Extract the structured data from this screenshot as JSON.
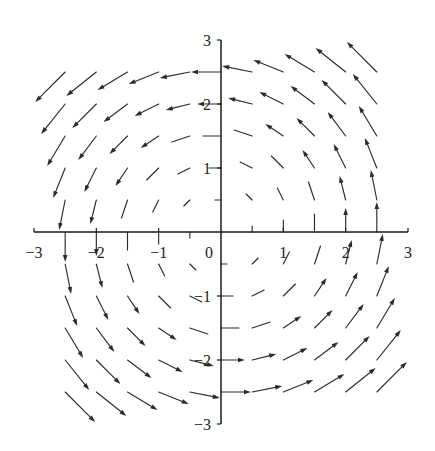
{
  "chart_data": {
    "type": "quiver",
    "title": "",
    "xlabel": "",
    "ylabel": "",
    "xlim": [
      -3,
      3
    ],
    "ylim": [
      -3,
      3
    ],
    "grid": false,
    "legend": null,
    "axes_through_origin": true,
    "arrow_grid_spacing": 0.5,
    "xticks": [
      -3,
      -2,
      -1,
      0,
      1,
      2,
      3
    ],
    "xtick_labels": [
      "−3",
      "−2",
      "−1",
      "0",
      "1",
      "2",
      "3"
    ],
    "yticks": [
      3,
      2,
      1,
      -1,
      -2,
      -3
    ],
    "ytick_labels": [
      "3",
      "2",
      "1",
      "−1",
      "−2",
      "−3"
    ],
    "colors": {
      "arrow": "#2b2b2b",
      "axis": "#1a1a1a",
      "background": "#ffffff"
    },
    "vectors_format": [
      "x",
      "y",
      "u",
      "v"
    ],
    "vectors": [
      [
        -2.5,
        2.5,
        -2.5,
        -2.5
      ],
      [
        -2,
        2.5,
        -2.5,
        -2
      ],
      [
        -1.5,
        2.5,
        -2.5,
        -1.5
      ],
      [
        -1,
        2.5,
        -2.5,
        -1
      ],
      [
        -0.5,
        2.5,
        -2.5,
        -0.5
      ],
      [
        0,
        2.5,
        -2.5,
        0
      ],
      [
        0.5,
        2.5,
        -2.5,
        0.5
      ],
      [
        1,
        2.5,
        -2.5,
        1
      ],
      [
        1.5,
        2.5,
        -2.5,
        1.5
      ],
      [
        2,
        2.5,
        -2.5,
        2
      ],
      [
        2.5,
        2.5,
        -2.5,
        2.5
      ],
      [
        -2.5,
        2,
        -2,
        -2.5
      ],
      [
        -2,
        2,
        -2,
        -2
      ],
      [
        -1.5,
        2,
        -2,
        -1.5
      ],
      [
        -1,
        2,
        -2,
        -1
      ],
      [
        -0.5,
        2,
        -2,
        -0.5
      ],
      [
        0,
        2,
        -2,
        0
      ],
      [
        0.5,
        2,
        -2,
        0.5
      ],
      [
        1,
        2,
        -2,
        1
      ],
      [
        1.5,
        2,
        -2,
        1.5
      ],
      [
        2,
        2,
        -2,
        2
      ],
      [
        2.5,
        2,
        -2,
        2.5
      ],
      [
        -2.5,
        1.5,
        -1.5,
        -2.5
      ],
      [
        -2,
        1.5,
        -1.5,
        -2
      ],
      [
        -1.5,
        1.5,
        -1.5,
        -1.5
      ],
      [
        -1,
        1.5,
        -1.5,
        -1
      ],
      [
        -0.5,
        1.5,
        -1.5,
        -0.5
      ],
      [
        0,
        1.5,
        -1.5,
        0
      ],
      [
        0.5,
        1.5,
        -1.5,
        0.5
      ],
      [
        1,
        1.5,
        -1.5,
        1
      ],
      [
        1.5,
        1.5,
        -1.5,
        1.5
      ],
      [
        2,
        1.5,
        -1.5,
        2
      ],
      [
        2.5,
        1.5,
        -1.5,
        2.5
      ],
      [
        -2.5,
        1,
        -1,
        -2.5
      ],
      [
        -2,
        1,
        -1,
        -2
      ],
      [
        -1.5,
        1,
        -1,
        -1.5
      ],
      [
        -1,
        1,
        -1,
        -1
      ],
      [
        -0.5,
        1,
        -1,
        -0.5
      ],
      [
        0,
        1,
        -1,
        0
      ],
      [
        0.5,
        1,
        -1,
        0.5
      ],
      [
        1,
        1,
        -1,
        1
      ],
      [
        1.5,
        1,
        -1,
        1.5
      ],
      [
        2,
        1,
        -1,
        2
      ],
      [
        2.5,
        1,
        -1,
        2.5
      ],
      [
        -2.5,
        0.5,
        -0.5,
        -2.5
      ],
      [
        -2,
        0.5,
        -0.5,
        -2
      ],
      [
        -1.5,
        0.5,
        -0.5,
        -1.5
      ],
      [
        -1,
        0.5,
        -0.5,
        -1
      ],
      [
        -0.5,
        0.5,
        -0.5,
        -0.5
      ],
      [
        0,
        0.5,
        -0.5,
        0
      ],
      [
        0.5,
        0.5,
        -0.5,
        0.5
      ],
      [
        1,
        0.5,
        -0.5,
        1
      ],
      [
        1.5,
        0.5,
        -0.5,
        1.5
      ],
      [
        2,
        0.5,
        -0.5,
        2
      ],
      [
        2.5,
        0.5,
        -0.5,
        2.5
      ],
      [
        -2.5,
        0,
        0,
        -2.5
      ],
      [
        -2,
        0,
        0,
        -2
      ],
      [
        -1.5,
        0,
        0,
        -1.5
      ],
      [
        -1,
        0,
        0,
        -1
      ],
      [
        -0.5,
        0,
        0,
        -0.5
      ],
      [
        0,
        0,
        0,
        0
      ],
      [
        0.5,
        0,
        0,
        0.5
      ],
      [
        1,
        0,
        0,
        1
      ],
      [
        1.5,
        0,
        0,
        1.5
      ],
      [
        2,
        0,
        0,
        2
      ],
      [
        2.5,
        0,
        0,
        2.5
      ],
      [
        -2.5,
        -0.5,
        0.5,
        -2.5
      ],
      [
        -2,
        -0.5,
        0.5,
        -2
      ],
      [
        -1.5,
        -0.5,
        0.5,
        -1.5
      ],
      [
        -1,
        -0.5,
        0.5,
        -1
      ],
      [
        -0.5,
        -0.5,
        0.5,
        -0.5
      ],
      [
        0,
        -0.5,
        0.5,
        0
      ],
      [
        0.5,
        -0.5,
        0.5,
        0.5
      ],
      [
        1,
        -0.5,
        0.5,
        1
      ],
      [
        1.5,
        -0.5,
        0.5,
        1.5
      ],
      [
        2,
        -0.5,
        0.5,
        2
      ],
      [
        2.5,
        -0.5,
        0.5,
        2.5
      ],
      [
        -2.5,
        -1,
        1,
        -2.5
      ],
      [
        -2,
        -1,
        1,
        -2
      ],
      [
        -1.5,
        -1,
        1,
        -1.5
      ],
      [
        -1,
        -1,
        1,
        -1
      ],
      [
        -0.5,
        -1,
        1,
        -0.5
      ],
      [
        0,
        -1,
        1,
        0
      ],
      [
        0.5,
        -1,
        1,
        0.5
      ],
      [
        1,
        -1,
        1,
        1
      ],
      [
        1.5,
        -1,
        1,
        1.5
      ],
      [
        2,
        -1,
        1,
        2
      ],
      [
        2.5,
        -1,
        1,
        2.5
      ],
      [
        -2.5,
        -1.5,
        1.5,
        -2.5
      ],
      [
        -2,
        -1.5,
        1.5,
        -2
      ],
      [
        -1.5,
        -1.5,
        1.5,
        -1.5
      ],
      [
        -1,
        -1.5,
        1.5,
        -1
      ],
      [
        -0.5,
        -1.5,
        1.5,
        -0.5
      ],
      [
        0,
        -1.5,
        1.5,
        0
      ],
      [
        0.5,
        -1.5,
        1.5,
        0.5
      ],
      [
        1,
        -1.5,
        1.5,
        1
      ],
      [
        1.5,
        -1.5,
        1.5,
        1.5
      ],
      [
        2,
        -1.5,
        1.5,
        2
      ],
      [
        2.5,
        -1.5,
        1.5,
        2.5
      ],
      [
        -2.5,
        -2,
        2,
        -2.5
      ],
      [
        -2,
        -2,
        2,
        -2
      ],
      [
        -1.5,
        -2,
        2,
        -1.5
      ],
      [
        -1,
        -2,
        2,
        -1
      ],
      [
        -0.5,
        -2,
        2,
        -0.5
      ],
      [
        0,
        -2,
        2,
        0
      ],
      [
        0.5,
        -2,
        2,
        0.5
      ],
      [
        1,
        -2,
        2,
        1
      ],
      [
        1.5,
        -2,
        2,
        1.5
      ],
      [
        2,
        -2,
        2,
        2
      ],
      [
        2.5,
        -2,
        2,
        2.5
      ],
      [
        -2.5,
        -2.5,
        2.5,
        -2.5
      ],
      [
        -2,
        -2.5,
        2.5,
        -2
      ],
      [
        -1.5,
        -2.5,
        2.5,
        -1.5
      ],
      [
        -1,
        -2.5,
        2.5,
        -1
      ],
      [
        -0.5,
        -2.5,
        2.5,
        -0.5
      ],
      [
        0,
        -2.5,
        2.5,
        0
      ],
      [
        0.5,
        -2.5,
        2.5,
        0.5
      ],
      [
        1,
        -2.5,
        2.5,
        1
      ],
      [
        1.5,
        -2.5,
        2.5,
        1.5
      ],
      [
        2,
        -2.5,
        2.5,
        2
      ],
      [
        2.5,
        -2.5,
        2.5,
        2.5
      ]
    ]
  }
}
